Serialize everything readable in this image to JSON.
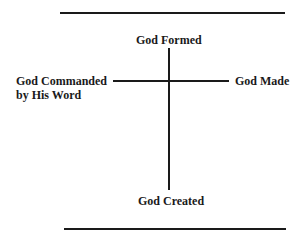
{
  "diagram": {
    "labels": {
      "top": "God Formed",
      "left_line1": "God Commanded",
      "left_line2": "by His Word",
      "right": "God Made",
      "bottom": "God Created"
    },
    "colors": {
      "ink": "#1a1a1a",
      "background": "#ffffff"
    }
  }
}
